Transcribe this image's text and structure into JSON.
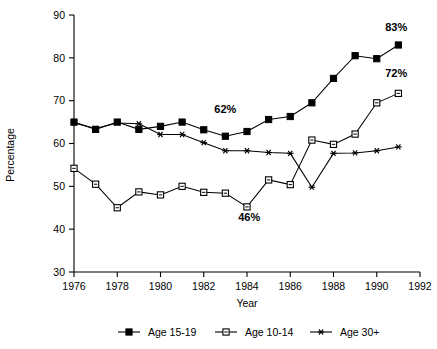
{
  "chart_data": {
    "type": "line",
    "title": "",
    "xlabel": "Year",
    "ylabel": "Percentage",
    "xlim": [
      1976,
      1992
    ],
    "ylim": [
      30,
      90
    ],
    "ytick_step": 10,
    "xtick_step": 2,
    "grid": false,
    "legend_position": "bottom",
    "x": [
      1976,
      1977,
      1978,
      1979,
      1980,
      1981,
      1982,
      1983,
      1984,
      1985,
      1986,
      1987,
      1988,
      1989,
      1990,
      1991
    ],
    "xticklabels": [
      "1976",
      "1978",
      "1980",
      "1982",
      "1984",
      "1986",
      "1988",
      "1990",
      "1992"
    ],
    "yticklabels": [
      "30",
      "40",
      "50",
      "60",
      "70",
      "80",
      "90"
    ],
    "series": [
      {
        "name": "Age 15-19",
        "marker": "filled-square",
        "values": [
          65.0,
          63.3,
          65.0,
          63.3,
          64.0,
          65.0,
          63.2,
          61.7,
          62.8,
          65.6,
          66.3,
          69.5,
          75.2,
          80.5,
          79.8,
          83.0
        ]
      },
      {
        "name": "Age 10-14",
        "marker": "open-square",
        "values": [
          54.2,
          50.5,
          45.0,
          48.7,
          48.0,
          50.0,
          48.6,
          48.4,
          45.2,
          51.5,
          50.4,
          60.8,
          59.8,
          62.2,
          69.5,
          71.7
        ]
      },
      {
        "name": "Age 30+",
        "marker": "asterisk",
        "values": [
          64.8,
          63.5,
          64.8,
          64.6,
          62.1,
          62.1,
          60.2,
          58.3,
          58.3,
          57.9,
          57.7,
          49.8,
          57.7,
          57.8,
          58.3,
          59.2
        ]
      }
    ],
    "annotations": [
      {
        "text": "62%",
        "x": 1983.0,
        "y": 67.2
      },
      {
        "text": "46%",
        "x": 1984.1,
        "y": 41.8
      },
      {
        "text": "83%",
        "x": 1990.9,
        "y": 86.3
      },
      {
        "text": "72%",
        "x": 1990.9,
        "y": 75.6
      }
    ]
  },
  "legend": {
    "items": [
      {
        "label": "Age 15-19",
        "marker": "filled-square"
      },
      {
        "label": "Age 10-14",
        "marker": "open-square"
      },
      {
        "label": "Age 30+",
        "marker": "asterisk"
      }
    ]
  },
  "colors": {
    "ink": "#000000",
    "background": "#ffffff",
    "marker_fill_open": "#ffffff"
  }
}
